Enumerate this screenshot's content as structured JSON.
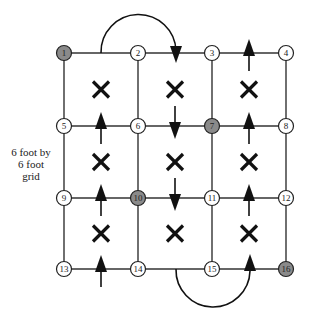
{
  "label": {
    "lines": [
      "6 foot by",
      "6 foot",
      "grid"
    ]
  },
  "colors": {
    "line": "#333333",
    "node_fill": "#ffffff",
    "node_highlight_fill": "#8a8a8a",
    "node_stroke": "#222222",
    "mark": "#111111"
  },
  "grid": {
    "columns_x": [
      64,
      138,
      212,
      286
    ],
    "rows_y": [
      53,
      126,
      198,
      269
    ],
    "node_radius": 7.5
  },
  "nodes": [
    {
      "id": "1",
      "highlighted": true
    },
    {
      "id": "2",
      "highlighted": false
    },
    {
      "id": "3",
      "highlighted": false
    },
    {
      "id": "4",
      "highlighted": false
    },
    {
      "id": "5",
      "highlighted": false
    },
    {
      "id": "6",
      "highlighted": false
    },
    {
      "id": "7",
      "highlighted": true
    },
    {
      "id": "8",
      "highlighted": false
    },
    {
      "id": "9",
      "highlighted": false
    },
    {
      "id": "10",
      "highlighted": true
    },
    {
      "id": "11",
      "highlighted": false
    },
    {
      "id": "12",
      "highlighted": false
    },
    {
      "id": "13",
      "highlighted": false
    },
    {
      "id": "14",
      "highlighted": false
    },
    {
      "id": "15",
      "highlighted": false
    },
    {
      "id": "16",
      "highlighted": true
    }
  ],
  "cell_marks": [
    {
      "col": 0,
      "row": 0,
      "symbol": "x"
    },
    {
      "col": 1,
      "row": 0,
      "symbol": "x"
    },
    {
      "col": 2,
      "row": 0,
      "symbol": "x"
    },
    {
      "col": 0,
      "row": 1,
      "symbol": "x"
    },
    {
      "col": 1,
      "row": 1,
      "symbol": "x"
    },
    {
      "col": 2,
      "row": 1,
      "symbol": "x"
    },
    {
      "col": 0,
      "row": 2,
      "symbol": "x"
    },
    {
      "col": 1,
      "row": 2,
      "symbol": "x"
    },
    {
      "col": 2,
      "row": 2,
      "symbol": "x"
    }
  ],
  "arrows": [
    {
      "lane": 0,
      "row": 1,
      "direction": "up"
    },
    {
      "lane": 0,
      "row": 2,
      "direction": "up"
    },
    {
      "lane": 0,
      "row": 3,
      "direction": "up"
    },
    {
      "lane": 1,
      "row": 1,
      "direction": "down"
    },
    {
      "lane": 1,
      "row": 2,
      "direction": "down"
    },
    {
      "lane": 2,
      "row": 0,
      "direction": "up"
    },
    {
      "lane": 2,
      "row": 1,
      "direction": "up"
    },
    {
      "lane": 2,
      "row": 2,
      "direction": "up"
    }
  ],
  "arcs": [
    {
      "from_x": 101,
      "to_x": 176,
      "y": 53,
      "side": "top",
      "arrow": "down"
    },
    {
      "from_x": 176,
      "to_x": 250,
      "y": 269,
      "side": "bottom",
      "arrow": "up"
    }
  ]
}
